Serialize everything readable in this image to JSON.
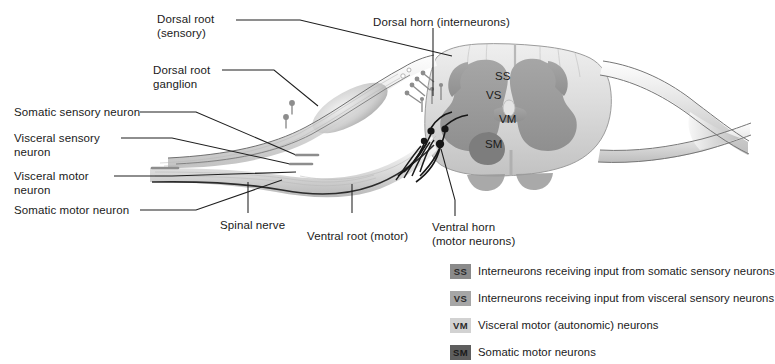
{
  "figure": {
    "background_color": "#ffffff"
  },
  "callouts": [
    {
      "id": "dorsal-root-sensory",
      "label": "Dorsal root\n(sensory)",
      "x": 157,
      "y": 13
    },
    {
      "id": "dorsal-root-ganglion",
      "label": "Dorsal root\nganglion",
      "x": 153,
      "y": 64
    },
    {
      "id": "somatic-sensory-neuron",
      "label": "Somatic sensory neuron",
      "x": 14,
      "y": 106
    },
    {
      "id": "visceral-sensory-neuron",
      "label": "Visceral sensory\nneuron",
      "x": 14,
      "y": 133
    },
    {
      "id": "visceral-motor-neuron",
      "label": "Visceral motor\nneuron",
      "x": 14,
      "y": 171
    },
    {
      "id": "somatic-motor-neuron",
      "label": "Somatic motor neuron",
      "x": 14,
      "y": 204
    },
    {
      "id": "spinal-nerve",
      "label": "Spinal nerve",
      "x": 220,
      "y": 219
    },
    {
      "id": "ventral-root-motor",
      "label": "Ventral root (motor)",
      "x": 310,
      "y": 230
    },
    {
      "id": "ventral-horn-motor-neurons",
      "label": "Ventral horn\n(motor neurons)",
      "x": 432,
      "y": 222
    },
    {
      "id": "dorsal-horn-interneurons",
      "label": "Dorsal horn (interneurons)",
      "x": 377,
      "y": 17
    }
  ],
  "cord_labels": [
    {
      "id": "ss",
      "text": "SS",
      "x": 495,
      "y": 76
    },
    {
      "id": "vs",
      "text": "VS",
      "x": 487,
      "y": 94
    },
    {
      "id": "vm",
      "text": "VM",
      "x": 500,
      "y": 118
    },
    {
      "id": "sm",
      "text": "SM",
      "x": 486,
      "y": 142
    }
  ],
  "legend": {
    "items": [
      {
        "code": "SS",
        "description": "Interneurons receiving input from somatic sensory neurons",
        "badge_color": "#8a8a8a",
        "badge_text_color": "#2b2b2b"
      },
      {
        "code": "VS",
        "description": "Interneurons receiving input from visceral sensory neurons",
        "badge_color": "#a6a6a6",
        "badge_text_color": "#2b2b2b"
      },
      {
        "code": "VM",
        "description": "Visceral motor (autonomic) neurons",
        "badge_color": "#d2d2d2",
        "badge_text_color": "#2b2b2b"
      },
      {
        "code": "SM",
        "description": "Somatic motor neurons",
        "badge_color": "#5e5e5e",
        "badge_text_color": "#1a1a1a"
      }
    ]
  },
  "colors": {
    "white_matter": "#dcdcdc",
    "gray_matter": "#9b9b9b",
    "nerve_light": "#e8e8e8",
    "outline": "#7a7a7a",
    "leader_line": "#2a2a2a",
    "neuron_dark": "#1c1c1c"
  }
}
